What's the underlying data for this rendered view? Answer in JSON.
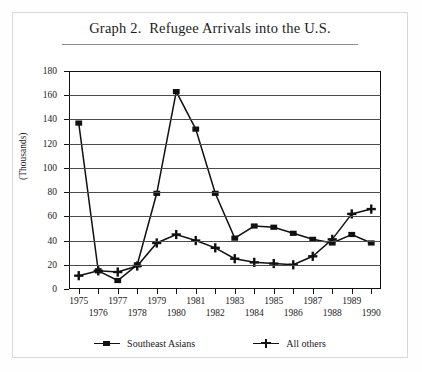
{
  "title": "Graph 2.  Refugee Arrivals into the U.S.",
  "legend": {
    "items": [
      {
        "label": "Southeast Asians",
        "marker": "square"
      },
      {
        "label": "All others",
        "marker": "plus"
      }
    ]
  },
  "axes": {
    "ylabel": "(Thousands)",
    "yticks": [
      "0",
      "20",
      "40",
      "60",
      "80",
      "100",
      "120",
      "140",
      "160",
      "180"
    ],
    "xticks_top": [
      "1975",
      "1977",
      "1979",
      "1981",
      "1983",
      "1985",
      "1987",
      "1989"
    ],
    "xticks_bottom": [
      "1976",
      "1978",
      "1980",
      "1982",
      "1984",
      "1986",
      "1988",
      "1990"
    ]
  },
  "chart_data": {
    "type": "line",
    "title": "Graph 2.  Refugee Arrivals into the U.S.",
    "xlabel": "",
    "ylabel": "(Thousands)",
    "ylim": [
      0,
      180
    ],
    "ytick_step": 20,
    "grid": true,
    "legend_position": "bottom",
    "x": [
      1975,
      1976,
      1977,
      1978,
      1979,
      1980,
      1981,
      1982,
      1983,
      1984,
      1985,
      1986,
      1987,
      1988,
      1989,
      1990
    ],
    "categories": [
      "1975",
      "1976",
      "1977",
      "1978",
      "1979",
      "1980",
      "1981",
      "1982",
      "1983",
      "1984",
      "1985",
      "1986",
      "1987",
      "1988",
      "1989",
      "1990"
    ],
    "series": [
      {
        "name": "Southeast Asians",
        "marker": "square",
        "color": "#111111",
        "values": [
          137,
          15,
          7,
          20,
          79,
          163,
          132,
          79,
          42,
          52,
          51,
          46,
          41,
          38,
          45,
          38
        ]
      },
      {
        "name": "All others",
        "marker": "plus",
        "color": "#111111",
        "values": [
          11,
          15,
          14,
          19,
          38,
          45,
          40,
          34,
          25,
          22,
          21,
          20,
          27,
          41,
          62,
          66
        ]
      }
    ]
  }
}
